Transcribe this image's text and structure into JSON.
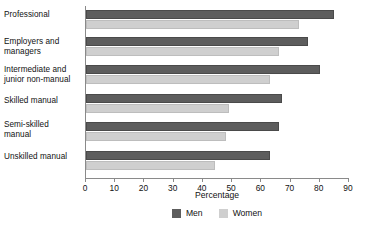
{
  "chart_data": {
    "type": "bar",
    "orientation": "horizontal",
    "title": "",
    "xlabel": "Percentage",
    "ylabel": "",
    "xlim": [
      0,
      90
    ],
    "xticks": [
      0,
      10,
      20,
      30,
      40,
      50,
      60,
      70,
      80,
      90
    ],
    "grid": false,
    "legend_position": "bottom-center",
    "categories": [
      "Professional",
      "Employers and managers",
      "Intermediate and junior non-manual",
      "Skilled manual",
      "Semi-skilled manual",
      "Unskilled manual"
    ],
    "series": [
      {
        "name": "Men",
        "color": "#5d5d5d",
        "values": [
          85,
          76,
          80,
          67,
          66,
          63
        ]
      },
      {
        "name": "Women",
        "color": "#cfcfcf",
        "values": [
          73,
          66,
          63,
          49,
          48,
          44
        ]
      }
    ]
  },
  "axis": {
    "x_title": "Percentage",
    "tick_labels": [
      "0",
      "10",
      "20",
      "30",
      "40",
      "50",
      "60",
      "70",
      "80",
      "90"
    ]
  },
  "categories_display": [
    {
      "line1": "Professional",
      "line2": ""
    },
    {
      "line1": "Employers and",
      "line2": "managers"
    },
    {
      "line1": "Intermediate and",
      "line2": "junior non-manual"
    },
    {
      "line1": "Skilled manual",
      "line2": ""
    },
    {
      "line1": "Semi-skilled",
      "line2": "manual"
    },
    {
      "line1": "Unskilled manual",
      "line2": ""
    }
  ],
  "legend": {
    "items": [
      {
        "label": "Men",
        "color": "#5d5d5d"
      },
      {
        "label": "Women",
        "color": "#cfcfcf"
      }
    ]
  }
}
